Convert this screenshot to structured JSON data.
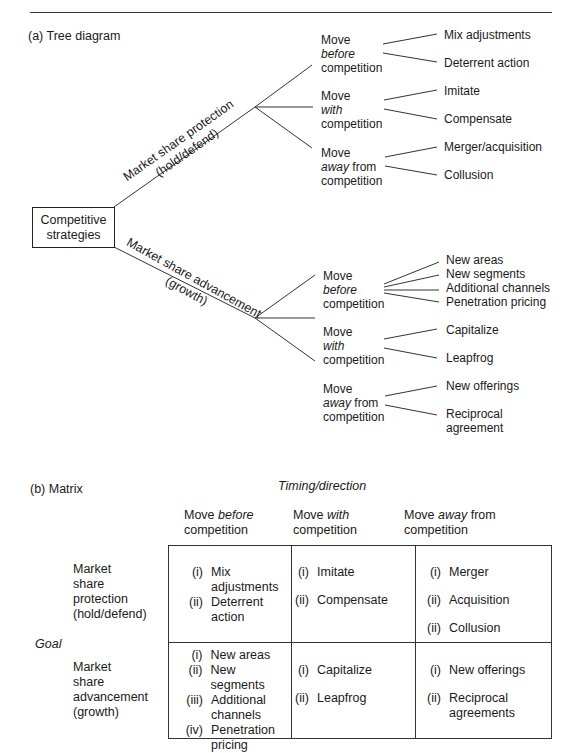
{
  "header_rule": true,
  "tree": {
    "section_label": "(a)  Tree diagram",
    "root": "Competitive strategies",
    "root_lines": [
      "Competitive",
      "strategies"
    ],
    "branches": [
      {
        "label": "Market share protection",
        "sublabel": "(hold/defend)",
        "moves": [
          {
            "line1": "Move",
            "keyword": "before",
            "suffix": "",
            "line3": "competition",
            "outcomes": [
              "Mix adjustments",
              "Deterrent action"
            ]
          },
          {
            "line1": "Move",
            "keyword": "with",
            "suffix": "",
            "line3": "competition",
            "outcomes": [
              "Imitate",
              "Compensate"
            ]
          },
          {
            "line1": "Move",
            "keyword": "away",
            "suffix": " from",
            "line3": "competition",
            "outcomes": [
              "Merger/acquisition",
              "Collusion"
            ]
          }
        ]
      },
      {
        "label": "Market share advancement",
        "sublabel": "(growth)",
        "moves": [
          {
            "line1": "Move",
            "keyword": "before",
            "suffix": "",
            "line3": "competition",
            "outcomes": [
              "New areas",
              "New segments",
              "Additional channels",
              "Penetration pricing"
            ]
          },
          {
            "line1": "Move",
            "keyword": "with",
            "suffix": "",
            "line3": "competition",
            "outcomes": [
              "Capitalize",
              "Leapfrog"
            ]
          },
          {
            "line1": "Move",
            "keyword": "away",
            "suffix": " from",
            "line3": "competition",
            "outcomes": [
              "New offerings",
              "Reciprocal agreement"
            ]
          }
        ]
      }
    ]
  },
  "matrix": {
    "section_label": "(b)  Matrix",
    "column_axis_title": "Timing/direction",
    "row_axis_title": "Goal",
    "columns": [
      {
        "pre": "Move ",
        "keyword": "before",
        "post": "",
        "line2": "competition"
      },
      {
        "pre": "Move ",
        "keyword": "with",
        "post": "",
        "line2": "competition"
      },
      {
        "pre": "Move ",
        "keyword": "away",
        "post": " from",
        "line2": "competition"
      }
    ],
    "rows": [
      {
        "label_lines": [
          "Market",
          "share",
          "protection",
          "(hold/defend)"
        ],
        "cells": [
          [
            {
              "n": "(i)",
              "t": "Mix adjustments"
            },
            {
              "n": "(ii)",
              "t": "Deterrent action"
            }
          ],
          [
            {
              "n": "(i)",
              "t": "Imitate"
            },
            {
              "n": "(ii)",
              "t": "Compensate"
            }
          ],
          [
            {
              "n": "(i)",
              "t": "Merger"
            },
            {
              "n": "(ii)",
              "t": "Acquisition"
            },
            {
              "n": "(ii)",
              "t": "Collusion"
            }
          ]
        ]
      },
      {
        "label_lines": [
          "Market",
          "share",
          "advancement",
          "(growth)"
        ],
        "cells": [
          [
            {
              "n": "(i)",
              "t": "New areas"
            },
            {
              "n": "(ii)",
              "t": "New segments"
            },
            {
              "n": "(iii)",
              "t": "Additional channels"
            },
            {
              "n": "(iv)",
              "t": "Penetration pricing"
            }
          ],
          [
            {
              "n": "(i)",
              "t": "Capitalize"
            },
            {
              "n": "(ii)",
              "t": "Leapfrog"
            }
          ],
          [
            {
              "n": "(i)",
              "t": "New offerings"
            },
            {
              "n": "(ii)",
              "t": "Reciprocal agreements"
            }
          ]
        ]
      }
    ]
  }
}
